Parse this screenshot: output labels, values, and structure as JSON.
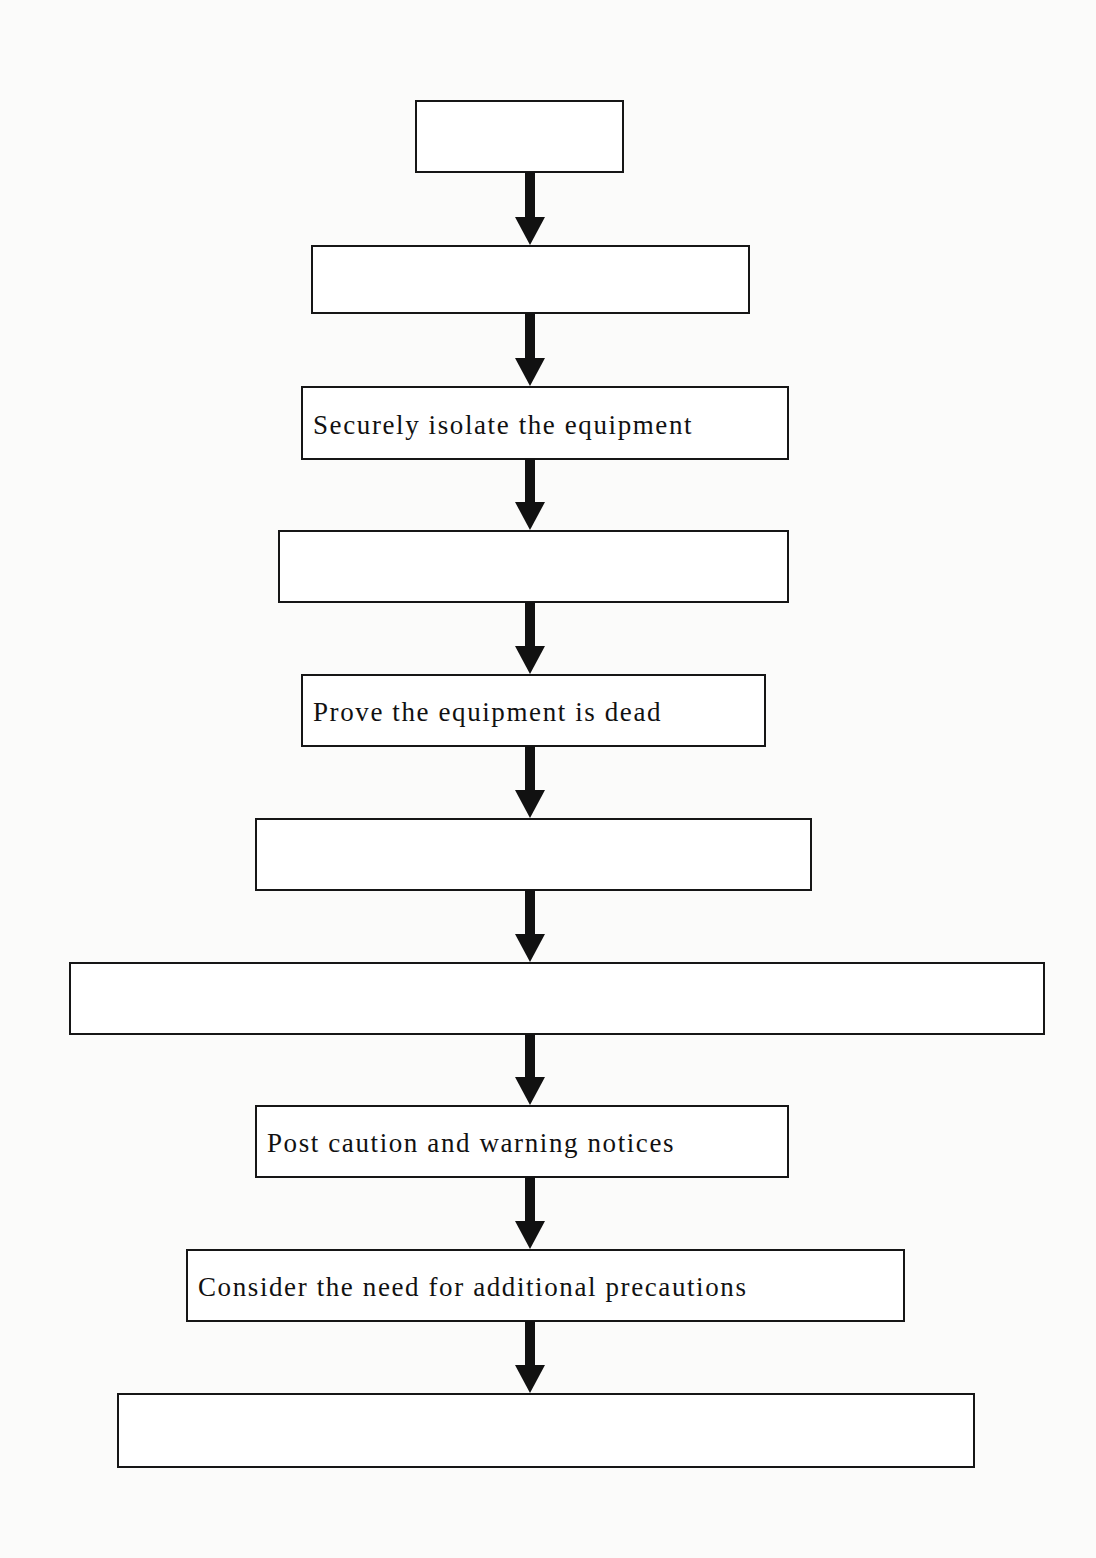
{
  "diagram": {
    "type": "vertical-flowchart",
    "colors": {
      "background": "#fbfbfa",
      "box_fill": "#ffffff",
      "box_border": "#161616",
      "text": "#111111",
      "arrow": "#111111"
    },
    "steps": [
      {
        "label": "",
        "box": {
          "left": 415,
          "top": 100,
          "width": 209,
          "height": 73
        }
      },
      {
        "label": "",
        "box": {
          "left": 311,
          "top": 245,
          "width": 439,
          "height": 69
        }
      },
      {
        "label": "Securely isolate the equipment",
        "box": {
          "left": 301,
          "top": 386,
          "width": 488,
          "height": 74
        }
      },
      {
        "label": "",
        "box": {
          "left": 278,
          "top": 530,
          "width": 511,
          "height": 73
        }
      },
      {
        "label": "Prove the equipment is dead",
        "box": {
          "left": 301,
          "top": 674,
          "width": 465,
          "height": 73
        }
      },
      {
        "label": "",
        "box": {
          "left": 255,
          "top": 818,
          "width": 557,
          "height": 73
        }
      },
      {
        "label": "",
        "box": {
          "left": 69,
          "top": 962,
          "width": 976,
          "height": 73
        }
      },
      {
        "label": "Post caution and warning notices",
        "box": {
          "left": 255,
          "top": 1105,
          "width": 534,
          "height": 73
        }
      },
      {
        "label": "Consider the need for additional precautions",
        "box": {
          "left": 186,
          "top": 1249,
          "width": 719,
          "height": 73
        }
      },
      {
        "label": "",
        "box": {
          "left": 117,
          "top": 1393,
          "width": 858,
          "height": 75
        }
      }
    ],
    "arrows": [
      {
        "from": 0,
        "to": 1,
        "top": 172,
        "bottom": 245
      },
      {
        "from": 1,
        "to": 2,
        "top": 313,
        "bottom": 386
      },
      {
        "from": 2,
        "to": 3,
        "top": 459,
        "bottom": 530
      },
      {
        "from": 3,
        "to": 4,
        "top": 602,
        "bottom": 674
      },
      {
        "from": 4,
        "to": 5,
        "top": 746,
        "bottom": 818
      },
      {
        "from": 5,
        "to": 6,
        "top": 890,
        "bottom": 962
      },
      {
        "from": 6,
        "to": 7,
        "top": 1034,
        "bottom": 1105
      },
      {
        "from": 7,
        "to": 8,
        "top": 1177,
        "bottom": 1249
      },
      {
        "from": 8,
        "to": 9,
        "top": 1321,
        "bottom": 1393
      }
    ],
    "arrow_center_x": 530,
    "arrow_icon": "down-arrow-icon"
  }
}
